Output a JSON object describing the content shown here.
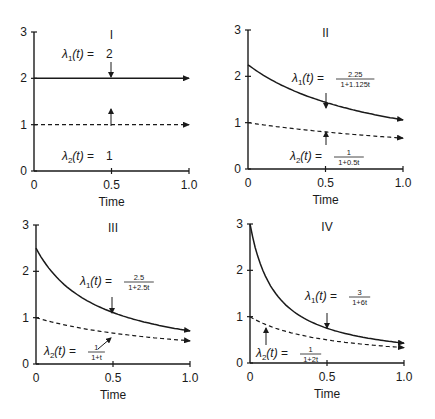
{
  "chart_data": [
    {
      "type": "line",
      "panel": "I",
      "title": "I",
      "xlabel": "Time",
      "ylabel": "",
      "xlim": [
        0,
        1.0
      ],
      "ylim": [
        0,
        3
      ],
      "x_ticks": [
        "0",
        "0.5",
        "1.0"
      ],
      "y_ticks": [
        "0",
        "1",
        "2",
        "3"
      ],
      "grid": false,
      "series": [
        {
          "name": "λ1(t) = 2",
          "style": "solid",
          "a": 2,
          "b": 0,
          "x": [
            0,
            0.5,
            1.0
          ],
          "values": [
            2,
            2,
            2
          ]
        },
        {
          "name": "λ2(t) = 1",
          "style": "dashed",
          "a": 1,
          "b": 0,
          "x": [
            0,
            0.5,
            1.0
          ],
          "values": [
            1,
            1,
            1
          ]
        }
      ],
      "annotations": [
        {
          "text": "λ1(t) = 2",
          "label_prefix": "λ1(t) =",
          "num": "2",
          "den": "",
          "arrow_to": [
            0.5,
            2
          ],
          "from": "above"
        },
        {
          "text": "λ2(t) = 1",
          "label_prefix": "λ2(t) =",
          "num": "1",
          "den": "",
          "arrow_to": [
            0.5,
            1
          ],
          "from": "below"
        }
      ]
    },
    {
      "type": "line",
      "panel": "II",
      "title": "II",
      "xlabel": "Time",
      "ylabel": "",
      "xlim": [
        0,
        1.0
      ],
      "ylim": [
        0,
        3
      ],
      "x_ticks": [
        "0",
        "0.5",
        "1.0"
      ],
      "y_ticks": [
        "0",
        "1",
        "2",
        "3"
      ],
      "grid": false,
      "series": [
        {
          "name": "λ1(t) = 2.25/(1+1.125t)",
          "style": "solid",
          "a": 2.25,
          "b": 1.125,
          "x": [
            0,
            0.5,
            1.0
          ],
          "values": [
            2.25,
            1.44,
            1.06
          ]
        },
        {
          "name": "λ2(t) = 1/(1+0.5t)",
          "style": "dashed",
          "a": 1,
          "b": 0.5,
          "x": [
            0,
            0.5,
            1.0
          ],
          "values": [
            1.0,
            0.8,
            0.67
          ]
        }
      ],
      "annotations": [
        {
          "text": "λ1(t) = 2.25/(1+1.125t)",
          "label_prefix": "λ1(t) =",
          "num": "2.25",
          "den": "1+1.125t",
          "arrow_to": [
            0.5,
            1.44
          ],
          "from": "above"
        },
        {
          "text": "λ2(t) = 1/(1+0.5t)",
          "label_prefix": "λ2(t) =",
          "num": "1",
          "den": "1+0.5t",
          "arrow_to": [
            0.5,
            0.8
          ],
          "from": "below"
        }
      ]
    },
    {
      "type": "line",
      "panel": "III",
      "title": "III",
      "xlabel": "Time",
      "ylabel": "",
      "xlim": [
        0,
        1.0
      ],
      "ylim": [
        0,
        3
      ],
      "x_ticks": [
        "0",
        "0.5",
        "1.0"
      ],
      "y_ticks": [
        "0",
        "1",
        "2",
        "3"
      ],
      "grid": false,
      "series": [
        {
          "name": "λ1(t) = 2.5/(1+2.5t)",
          "style": "solid",
          "a": 2.5,
          "b": 2.5,
          "x": [
            0,
            0.5,
            1.0
          ],
          "values": [
            2.5,
            1.11,
            0.71
          ]
        },
        {
          "name": "λ2(t) = 1/(1+t)",
          "style": "dashed",
          "a": 1,
          "b": 1,
          "x": [
            0,
            0.5,
            1.0
          ],
          "values": [
            1.0,
            0.67,
            0.5
          ]
        }
      ],
      "annotations": [
        {
          "text": "λ1(t) = 2.5/(1+2.5t)",
          "label_prefix": "λ1(t) =",
          "num": "2.5",
          "den": "1+2.5t",
          "arrow_to": [
            0.5,
            1.11
          ],
          "from": "above"
        },
        {
          "text": "λ2(t) = 1/(1+t)",
          "label_prefix": "λ2(t) =",
          "num": "1",
          "den": "1+t",
          "arrow_to": [
            0.5,
            0.67
          ],
          "from": "below-left"
        }
      ]
    },
    {
      "type": "line",
      "panel": "IV",
      "title": "IV",
      "xlabel": "Time",
      "ylabel": "",
      "xlim": [
        0,
        1.0
      ],
      "ylim": [
        0,
        3
      ],
      "x_ticks": [
        "0",
        "0.5",
        "1.0"
      ],
      "y_ticks": [
        "0",
        "1",
        "2",
        "3"
      ],
      "grid": false,
      "series": [
        {
          "name": "λ1(t) = 3/(1+6t)",
          "style": "solid",
          "a": 3,
          "b": 6,
          "x": [
            0,
            0.5,
            1.0
          ],
          "values": [
            3.0,
            0.75,
            0.43
          ]
        },
        {
          "name": "λ2(t) = 1/(1+2t)",
          "style": "dashed",
          "a": 1,
          "b": 2,
          "x": [
            0,
            0.5,
            1.0
          ],
          "values": [
            1.0,
            0.5,
            0.33
          ]
        }
      ],
      "annotations": [
        {
          "text": "λ1(t) = 3/(1+6t)",
          "label_prefix": "λ1(t) =",
          "num": "3",
          "den": "1+6t",
          "arrow_to": [
            0.5,
            0.75
          ],
          "from": "above"
        },
        {
          "text": "λ2(t) = 1/(1+2t)",
          "label_prefix": "λ2(t) =",
          "num": "1",
          "den": "1+2t",
          "arrow_to": [
            0.12,
            0.8
          ],
          "from": "below"
        }
      ]
    }
  ]
}
